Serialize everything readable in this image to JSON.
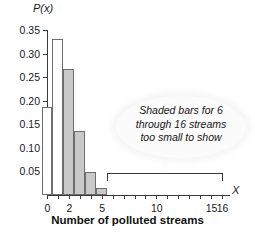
{
  "chart_data": {
    "type": "bar",
    "title": "",
    "xlabel": "Number of polluted streams",
    "ylabel": "P(x)",
    "axis_variable_label": "X",
    "categories": [
      0,
      1,
      2,
      3,
      4,
      5,
      6,
      7,
      8,
      9,
      10,
      11,
      12,
      13,
      14,
      15,
      16
    ],
    "values": [
      0.187,
      0.33,
      0.268,
      0.135,
      0.048,
      0.015,
      0,
      0,
      0,
      0,
      0,
      0,
      0,
      0,
      0,
      0,
      0
    ],
    "bar_styles": [
      "open",
      "open",
      "shaded",
      "shaded",
      "shaded",
      "shaded",
      "shaded",
      "shaded",
      "shaded",
      "shaded",
      "shaded",
      "shaded",
      "shaded",
      "shaded",
      "shaded",
      "shaded",
      "shaded"
    ],
    "ylim": [
      0,
      0.37
    ],
    "xlim": [
      -0.5,
      16.5
    ],
    "grid": false,
    "legend": "none",
    "yticks": [
      0.05,
      0.1,
      0.15,
      0.2,
      0.25,
      0.3,
      0.35
    ],
    "ytick_labels": [
      "0.05",
      "0.10",
      "0.15",
      "0.20",
      "0.25",
      "0.30",
      "0.35"
    ],
    "xticks": [
      0,
      1,
      2,
      3,
      4,
      5,
      6,
      7,
      8,
      9,
      10,
      11,
      12,
      13,
      14,
      15,
      16
    ],
    "xtick_labels": [
      "0",
      "",
      "2",
      "",
      "",
      "5",
      "",
      "",
      "",
      "",
      "10",
      "",
      "",
      "",
      "",
      "15",
      "16"
    ],
    "annotations": [
      {
        "name": "shaded-bars-note",
        "lines": [
          "Shaded bars for 6",
          "through 16 streams",
          "too small to show"
        ],
        "style": "italic"
      },
      {
        "name": "range-bracket",
        "from": 6,
        "to": 16
      }
    ],
    "colors": {
      "shaded_fill": "#c9c9c9",
      "open_fill": "#ffffff",
      "bar_stroke": "#6e6e6e",
      "axis": "#3a3a3a",
      "text": "#1a1a1a"
    }
  }
}
